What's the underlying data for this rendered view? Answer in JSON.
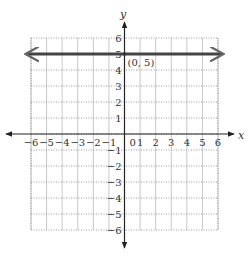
{
  "chart_data": {
    "type": "line",
    "title": "",
    "xlabel": "x",
    "ylabel": "y",
    "xlim": [
      -6,
      6
    ],
    "ylim": [
      -6,
      6
    ],
    "grid": true,
    "x_ticks": [
      "-6",
      "-5",
      "-4",
      "-3",
      "-2",
      "-1",
      "0",
      "1",
      "2",
      "3",
      "4",
      "5",
      "6"
    ],
    "y_ticks": [
      "6",
      "5",
      "4",
      "3",
      "2",
      "1",
      "-1",
      "-2",
      "-3",
      "-4",
      "-5",
      "-6"
    ],
    "series": [
      {
        "name": "y = 5",
        "x": [
          -6,
          6
        ],
        "y": [
          5,
          5
        ],
        "style": "thick line with arrows at both ends",
        "color": "#444444"
      }
    ],
    "annotations": [
      {
        "text": "(0, 5)",
        "x": 0,
        "y": 5
      }
    ],
    "colors": {
      "line": "#444444",
      "axes": "#222222",
      "grid": "#c8c8c8"
    }
  }
}
